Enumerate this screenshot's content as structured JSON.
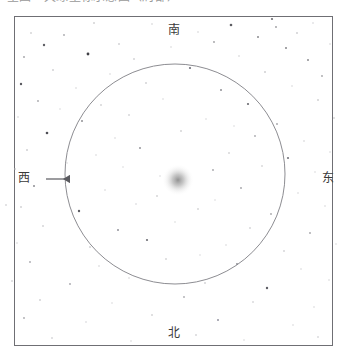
{
  "header": {
    "clipped_text": "星图 · 天球坐标示意图（局部）"
  },
  "chart_data": {
    "type": "scatter",
    "title": "",
    "xlabel": "",
    "ylabel": "",
    "grid": false,
    "legend": null,
    "frame": {
      "x": 14,
      "y": 16,
      "width": 319,
      "height": 330,
      "border_color": "#6f6f74"
    },
    "horizon_circle": {
      "label": "horizon-circle",
      "center_x": 175,
      "center_y": 174,
      "radius": 110,
      "stroke": "#8d8d92",
      "stroke_width": 1
    },
    "zenith_glow": {
      "label": "center-nebula-glow",
      "center_x": 178,
      "center_y": 180,
      "radius": 16,
      "color": "#8b8b8b"
    },
    "direction_markers": [
      {
        "name": "south",
        "label": "南",
        "x": 174,
        "y": 30,
        "position": "top"
      },
      {
        "name": "north",
        "label": "北",
        "x": 174,
        "y": 333,
        "position": "bottom"
      },
      {
        "name": "east",
        "label": "东",
        "x": 328,
        "y": 178,
        "position": "right"
      },
      {
        "name": "west",
        "label": "西",
        "x": 24,
        "y": 178,
        "position": "left"
      }
    ],
    "west_arrow": {
      "label": "west-direction-arrow",
      "x1": 70,
      "y1": 179,
      "x2": 46,
      "y2": 179,
      "color": "#5a5a5f",
      "head": "left"
    },
    "stars": [
      {
        "x": 272,
        "y": 19,
        "r": 1.1,
        "c": "#6e6e73"
      },
      {
        "x": 94,
        "y": 23,
        "r": 0.8,
        "c": "#b3b3b6"
      },
      {
        "x": 152,
        "y": 24,
        "r": 0.7,
        "c": "#c2c2c5"
      },
      {
        "x": 231,
        "y": 25,
        "r": 1.3,
        "c": "#5d5d62"
      },
      {
        "x": 276,
        "y": 27,
        "r": 0.9,
        "c": "#9a9a9e"
      },
      {
        "x": 313,
        "y": 23,
        "r": 0.7,
        "c": "#c6c6c9"
      },
      {
        "x": 31,
        "y": 33,
        "r": 0.8,
        "c": "#b8b8bb"
      },
      {
        "x": 64,
        "y": 35,
        "r": 0.9,
        "c": "#a8a8ac"
      },
      {
        "x": 198,
        "y": 32,
        "r": 0.7,
        "c": "#c4c4c7"
      },
      {
        "x": 258,
        "y": 37,
        "r": 1.0,
        "c": "#8a8a8e"
      },
      {
        "x": 297,
        "y": 33,
        "r": 0.8,
        "c": "#b0b0b4"
      },
      {
        "x": 44,
        "y": 45,
        "r": 1.2,
        "c": "#5f5f64"
      },
      {
        "x": 119,
        "y": 44,
        "r": 0.8,
        "c": "#b5b5b8"
      },
      {
        "x": 171,
        "y": 47,
        "r": 0.7,
        "c": "#cacacd"
      },
      {
        "x": 214,
        "y": 42,
        "r": 0.9,
        "c": "#9e9ea2"
      },
      {
        "x": 286,
        "y": 48,
        "r": 1.0,
        "c": "#86868a"
      },
      {
        "x": 330,
        "y": 44,
        "r": 0.7,
        "c": "#c8c8cb"
      },
      {
        "x": 24,
        "y": 57,
        "r": 0.9,
        "c": "#a0a0a4"
      },
      {
        "x": 88,
        "y": 54,
        "r": 1.4,
        "c": "#3f3f45"
      },
      {
        "x": 134,
        "y": 59,
        "r": 0.8,
        "c": "#b7b7ba"
      },
      {
        "x": 239,
        "y": 56,
        "r": 0.7,
        "c": "#c3c3c6"
      },
      {
        "x": 308,
        "y": 60,
        "r": 1.0,
        "c": "#8c8c90"
      },
      {
        "x": 53,
        "y": 70,
        "r": 0.8,
        "c": "#b2b2b6"
      },
      {
        "x": 110,
        "y": 74,
        "r": 0.7,
        "c": "#c9c9cc"
      },
      {
        "x": 190,
        "y": 68,
        "r": 1.1,
        "c": "#70707a"
      },
      {
        "x": 265,
        "y": 72,
        "r": 0.8,
        "c": "#aeaeb2"
      },
      {
        "x": 322,
        "y": 76,
        "r": 0.9,
        "c": "#a4a4a8"
      },
      {
        "x": 21,
        "y": 84,
        "r": 1.2,
        "c": "#5a5a60"
      },
      {
        "x": 76,
        "y": 88,
        "r": 0.7,
        "c": "#c7c7ca"
      },
      {
        "x": 146,
        "y": 83,
        "r": 0.8,
        "c": "#b4b4b8"
      },
      {
        "x": 221,
        "y": 90,
        "r": 1.0,
        "c": "#8f8f94"
      },
      {
        "x": 292,
        "y": 86,
        "r": 0.7,
        "c": "#cbcbce"
      },
      {
        "x": 38,
        "y": 101,
        "r": 0.9,
        "c": "#a6a6aa"
      },
      {
        "x": 101,
        "y": 105,
        "r": 0.8,
        "c": "#b9b9bc"
      },
      {
        "x": 163,
        "y": 99,
        "r": 0.7,
        "c": "#cdcdd0"
      },
      {
        "x": 248,
        "y": 104,
        "r": 1.1,
        "c": "#6a6a70"
      },
      {
        "x": 318,
        "y": 100,
        "r": 0.8,
        "c": "#b1b1b5"
      },
      {
        "x": 18,
        "y": 117,
        "r": 0.7,
        "c": "#c5c5c8"
      },
      {
        "x": 82,
        "y": 121,
        "r": 1.0,
        "c": "#909095"
      },
      {
        "x": 129,
        "y": 115,
        "r": 0.8,
        "c": "#bcbcbf"
      },
      {
        "x": 206,
        "y": 119,
        "r": 0.7,
        "c": "#cececf"
      },
      {
        "x": 277,
        "y": 124,
        "r": 0.9,
        "c": "#a2a2a6"
      },
      {
        "x": 334,
        "y": 118,
        "r": 0.8,
        "c": "#bdbdc0"
      },
      {
        "x": 47,
        "y": 133,
        "r": 1.3,
        "c": "#4e4e55"
      },
      {
        "x": 115,
        "y": 138,
        "r": 0.7,
        "c": "#cacacd"
      },
      {
        "x": 181,
        "y": 131,
        "r": 0.8,
        "c": "#b6b6b9"
      },
      {
        "x": 255,
        "y": 136,
        "r": 0.9,
        "c": "#a9a9ad"
      },
      {
        "x": 304,
        "y": 141,
        "r": 0.7,
        "c": "#c1c1c4"
      },
      {
        "x": 27,
        "y": 150,
        "r": 0.8,
        "c": "#b0b0b4"
      },
      {
        "x": 96,
        "y": 155,
        "r": 0.7,
        "c": "#cbcbce"
      },
      {
        "x": 140,
        "y": 148,
        "r": 1.0,
        "c": "#94949a"
      },
      {
        "x": 229,
        "y": 153,
        "r": 0.8,
        "c": "#bababd"
      },
      {
        "x": 288,
        "y": 158,
        "r": 1.1,
        "c": "#75757c"
      },
      {
        "x": 330,
        "y": 152,
        "r": 0.7,
        "c": "#c9c9cc"
      },
      {
        "x": 15,
        "y": 169,
        "r": 0.8,
        "c": "#b3b3b7"
      },
      {
        "x": 67,
        "y": 163,
        "r": 0.7,
        "c": "#cccccf"
      },
      {
        "x": 213,
        "y": 170,
        "r": 0.9,
        "c": "#a5a5a9"
      },
      {
        "x": 262,
        "y": 166,
        "r": 0.8,
        "c": "#bfbfc2"
      },
      {
        "x": 315,
        "y": 172,
        "r": 0.7,
        "c": "#cdcdd0"
      },
      {
        "x": 6,
        "y": 205,
        "r": 0.8,
        "c": "#c0c0c3"
      },
      {
        "x": 34,
        "y": 186,
        "r": 1.0,
        "c": "#8d8d92"
      },
      {
        "x": 105,
        "y": 190,
        "r": 0.7,
        "c": "#c8c8cb"
      },
      {
        "x": 157,
        "y": 196,
        "r": 0.8,
        "c": "#b8b8bc"
      },
      {
        "x": 241,
        "y": 188,
        "r": 0.9,
        "c": "#a1a1a6"
      },
      {
        "x": 298,
        "y": 193,
        "r": 0.7,
        "c": "#cbcbce"
      },
      {
        "x": 21,
        "y": 207,
        "r": 0.8,
        "c": "#b5b5b9"
      },
      {
        "x": 79,
        "y": 211,
        "r": 1.2,
        "c": "#5c5c62"
      },
      {
        "x": 136,
        "y": 204,
        "r": 0.7,
        "c": "#c6c6c9"
      },
      {
        "x": 198,
        "y": 209,
        "r": 0.8,
        "c": "#bbbbbe"
      },
      {
        "x": 271,
        "y": 214,
        "r": 0.9,
        "c": "#a7a7ab"
      },
      {
        "x": 325,
        "y": 206,
        "r": 0.7,
        "c": "#cacacd"
      },
      {
        "x": 43,
        "y": 226,
        "r": 0.8,
        "c": "#b7b7ba"
      },
      {
        "x": 118,
        "y": 230,
        "r": 1.0,
        "c": "#92929a"
      },
      {
        "x": 175,
        "y": 222,
        "r": 0.7,
        "c": "#cecfd1"
      },
      {
        "x": 250,
        "y": 228,
        "r": 0.8,
        "c": "#bcbcc0"
      },
      {
        "x": 310,
        "y": 233,
        "r": 0.9,
        "c": "#a3a3a8"
      },
      {
        "x": 17,
        "y": 243,
        "r": 0.7,
        "c": "#c7c7ca"
      },
      {
        "x": 90,
        "y": 247,
        "r": 0.8,
        "c": "#b2b2b6"
      },
      {
        "x": 147,
        "y": 240,
        "r": 1.1,
        "c": "#6d6d74"
      },
      {
        "x": 226,
        "y": 245,
        "r": 0.7,
        "c": "#c9c9cc"
      },
      {
        "x": 284,
        "y": 251,
        "r": 0.8,
        "c": "#b9b9bd"
      },
      {
        "x": 336,
        "y": 244,
        "r": 0.7,
        "c": "#cdcdd0"
      },
      {
        "x": 30,
        "y": 262,
        "r": 0.9,
        "c": "#a8a8ad"
      },
      {
        "x": 99,
        "y": 266,
        "r": 0.7,
        "c": "#c4c4c7"
      },
      {
        "x": 166,
        "y": 259,
        "r": 0.8,
        "c": "#bababe"
      },
      {
        "x": 237,
        "y": 264,
        "r": 1.0,
        "c": "#8e8e94"
      },
      {
        "x": 301,
        "y": 269,
        "r": 0.7,
        "c": "#cbcbce"
      },
      {
        "x": 12,
        "y": 281,
        "r": 0.8,
        "c": "#bdbdc1"
      },
      {
        "x": 70,
        "y": 284,
        "r": 0.9,
        "c": "#a5a5aa"
      },
      {
        "x": 129,
        "y": 278,
        "r": 0.7,
        "c": "#c8c8cb"
      },
      {
        "x": 205,
        "y": 283,
        "r": 0.8,
        "c": "#b6b6ba"
      },
      {
        "x": 267,
        "y": 288,
        "r": 1.2,
        "c": "#5e5e65"
      },
      {
        "x": 329,
        "y": 280,
        "r": 0.7,
        "c": "#cacacd"
      },
      {
        "x": 40,
        "y": 300,
        "r": 0.8,
        "c": "#b4b4b8"
      },
      {
        "x": 112,
        "y": 303,
        "r": 0.7,
        "c": "#cccccf"
      },
      {
        "x": 184,
        "y": 297,
        "r": 0.9,
        "c": "#aaaaaf"
      },
      {
        "x": 253,
        "y": 302,
        "r": 0.8,
        "c": "#bfbfc3"
      },
      {
        "x": 314,
        "y": 307,
        "r": 0.7,
        "c": "#c9c9cc"
      },
      {
        "x": 24,
        "y": 318,
        "r": 0.9,
        "c": "#a9a9ae"
      },
      {
        "x": 86,
        "y": 322,
        "r": 0.7,
        "c": "#c6c6ca"
      },
      {
        "x": 152,
        "y": 315,
        "r": 0.8,
        "c": "#b8b8bc"
      },
      {
        "x": 218,
        "y": 320,
        "r": 1.0,
        "c": "#9393a0"
      },
      {
        "x": 293,
        "y": 325,
        "r": 0.7,
        "c": "#cbcbce"
      },
      {
        "x": 52,
        "y": 338,
        "r": 0.8,
        "c": "#bebec2"
      },
      {
        "x": 131,
        "y": 341,
        "r": 0.7,
        "c": "#cacacd"
      },
      {
        "x": 196,
        "y": 335,
        "r": 0.8,
        "c": "#bbbbc0"
      },
      {
        "x": 244,
        "y": 340,
        "r": 0.7,
        "c": "#cdcdd0"
      },
      {
        "x": 318,
        "y": 337,
        "r": 0.8,
        "c": "#c2c2c6"
      },
      {
        "x": 60,
        "y": 109,
        "r": 0.7,
        "c": "#cfcfd2"
      },
      {
        "x": 160,
        "y": 176,
        "r": 0.7,
        "c": "#d0d0d3"
      },
      {
        "x": 200,
        "y": 255,
        "r": 0.7,
        "c": "#cfcfd2"
      },
      {
        "x": 234,
        "y": 126,
        "r": 0.7,
        "c": "#d0d0d3"
      },
      {
        "x": 123,
        "y": 167,
        "r": 0.7,
        "c": "#cfcfd2"
      },
      {
        "x": 215,
        "y": 200,
        "r": 0.7,
        "c": "#d0d0d3"
      }
    ]
  }
}
